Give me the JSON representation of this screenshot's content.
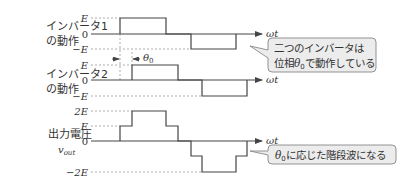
{
  "panels": [
    {
      "id": "inverter1",
      "label_line1": "インバータ1",
      "label_line2": "の動作",
      "ticks": [
        "E",
        "0",
        "−E"
      ],
      "axis_label": "ωt"
    },
    {
      "id": "inverter2",
      "label_line1": "インバータ2",
      "label_line2": "の動作",
      "ticks": [
        "E",
        "0",
        "−E"
      ],
      "axis_label": "ωt"
    },
    {
      "id": "output",
      "label_line1": "出力電圧",
      "label_line2": "v",
      "label_line2_sub": "out",
      "ticks": [
        "2E",
        "E",
        "0",
        "−2E"
      ],
      "axis_label": "ωt"
    }
  ],
  "phase_annotation": {
    "symbol": "θ",
    "subscript": "0"
  },
  "callouts": [
    {
      "line1": "二つのインバータは",
      "line2_prefix": "位相",
      "line2_symbol": "θ",
      "line2_sub": "0",
      "line2_suffix": "で動作している"
    },
    {
      "symbol": "θ",
      "sub": "0",
      "suffix": "に応じた階段波になる"
    }
  ],
  "colors": {
    "line": "#444444",
    "dashed": "#999999",
    "callout_fill": "#ececec",
    "callout_stroke": "#888888",
    "text": "#333333"
  }
}
